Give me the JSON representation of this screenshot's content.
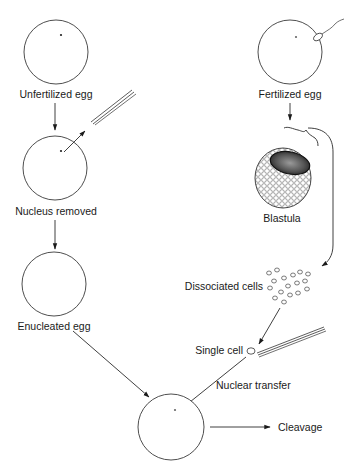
{
  "diagram": {
    "title": "",
    "colors": {
      "line": "#2a2a2a",
      "text": "#1a1a1a",
      "background": "#ffffff"
    },
    "nodes": [
      {
        "id": "unfertilized-egg",
        "label": "Unfertilized egg"
      },
      {
        "id": "nucleus-removed",
        "label": "Nucleus removed"
      },
      {
        "id": "enucleated-egg",
        "label": "Enucleated egg"
      },
      {
        "id": "fertilized-egg",
        "label": "Fertilized egg"
      },
      {
        "id": "blastula",
        "label": "Blastula"
      },
      {
        "id": "dissociated-cells",
        "label": "Dissociated cells"
      },
      {
        "id": "single-cell",
        "label": "Single cell"
      },
      {
        "id": "nuclear-transfer",
        "label": "Nuclear transfer"
      },
      {
        "id": "recipient-egg",
        "label": ""
      },
      {
        "id": "cleavage",
        "label": "Cleavage"
      }
    ],
    "edges": [
      {
        "from": "unfertilized-egg",
        "to": "nucleus-removed"
      },
      {
        "from": "nucleus-removed",
        "to": "pipette",
        "note": "nucleus extracted by micropipette"
      },
      {
        "from": "nucleus-removed",
        "to": "enucleated-egg"
      },
      {
        "from": "enucleated-egg",
        "to": "recipient-egg"
      },
      {
        "from": "fertilized-egg",
        "to": "blastula"
      },
      {
        "from": "blastula",
        "to": "dissociated-cells"
      },
      {
        "from": "dissociated-cells",
        "to": "single-cell"
      },
      {
        "from": "single-cell",
        "to": "recipient-egg",
        "label": "Nuclear transfer"
      },
      {
        "from": "recipient-egg",
        "to": "cleavage"
      }
    ]
  }
}
